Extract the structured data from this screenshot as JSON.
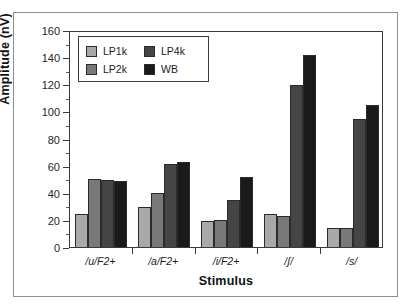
{
  "chart_data": {
    "type": "bar",
    "title": "",
    "xlabel": "Stimulus",
    "ylabel": "Amplitude (nV)",
    "ylim": [
      0,
      160
    ],
    "ytick_step": 20,
    "yticks": [
      0,
      20,
      40,
      60,
      80,
      100,
      120,
      140,
      160
    ],
    "ytick_labels": [
      "0",
      "20",
      "40",
      "60",
      "80",
      "100",
      "120",
      "140",
      "160"
    ],
    "grid": false,
    "legend_position": "upper-left-inside",
    "categories": [
      "/u/F2+",
      "/a/F2+",
      "/i/F2+",
      "/ʃ/",
      "/s/"
    ],
    "series": [
      {
        "name": "LP1k",
        "color": "#a9a9a9",
        "values": [
          24.5,
          29.5,
          19.5,
          24.5,
          14.0
        ]
      },
      {
        "name": "LP2k",
        "color": "#797979",
        "values": [
          50.5,
          40.0,
          20.0,
          22.5,
          14.0
        ]
      },
      {
        "name": "LP4k",
        "color": "#454545",
        "values": [
          49.5,
          61.5,
          34.5,
          119.5,
          94.5
        ]
      },
      {
        "name": "WB",
        "color": "#1a1a1a",
        "values": [
          48.5,
          62.5,
          51.5,
          141.5,
          105.0
        ]
      }
    ]
  },
  "figure": {
    "frame_color": "#8d8d8d",
    "axis_color": "#3a3a3a",
    "background": "#ffffff"
  }
}
